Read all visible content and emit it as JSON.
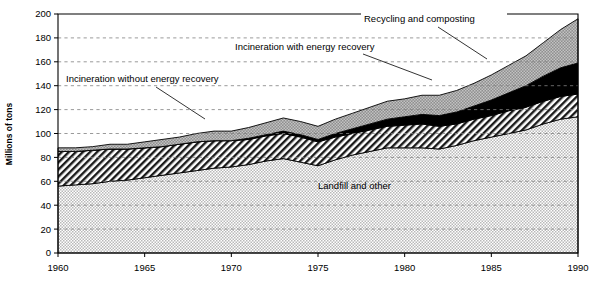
{
  "chart": {
    "type": "area",
    "ylabel": "Millions of tons",
    "xlabel": "",
    "title": "",
    "ylim": [
      0,
      200
    ],
    "xlim": [
      1960,
      1990
    ],
    "yticks": [
      "0",
      "20",
      "40",
      "60",
      "80",
      "100",
      "120",
      "140",
      "160",
      "180",
      "200"
    ],
    "xticks": [
      "1960",
      "1965",
      "1970",
      "1975",
      "1980",
      "1985",
      "1990"
    ],
    "grid": "horizontal-dashed",
    "legend_position": "inline-annotations",
    "colors": {
      "landfill": "#d4d4d4",
      "incineration_without": "#ffffff",
      "incineration_with": "#000000",
      "recycling": "#a8a8a8",
      "gridline": "#808080",
      "axis": "#000000"
    },
    "annotations": [
      {
        "id": "recycling",
        "label": "Recycling and composting"
      },
      {
        "id": "inc_with",
        "label": "Incineration with energy recovery"
      },
      {
        "id": "inc_without",
        "label": "Incineration without energy recovery"
      },
      {
        "id": "landfill",
        "label": "Landfill and other"
      }
    ]
  },
  "chart_data": {
    "type": "area",
    "stacked": true,
    "title": "",
    "xlabel": "",
    "ylabel": "Millions of tons",
    "ylim": [
      0,
      200
    ],
    "xlim": [
      1960,
      1990
    ],
    "grid": true,
    "legend_position": "inline-annotations",
    "x": [
      1960,
      1961,
      1962,
      1963,
      1964,
      1965,
      1966,
      1967,
      1968,
      1969,
      1970,
      1971,
      1972,
      1973,
      1974,
      1975,
      1976,
      1977,
      1978,
      1979,
      1980,
      1981,
      1982,
      1983,
      1984,
      1985,
      1986,
      1987,
      1988,
      1989,
      1990
    ],
    "series": [
      {
        "name": "Landfill and other",
        "values": [
          56,
          57,
          58,
          60,
          61,
          63,
          65,
          67,
          69,
          71,
          72,
          74,
          77,
          79,
          76,
          73,
          78,
          82,
          85,
          88,
          88,
          88,
          87,
          90,
          94,
          97,
          100,
          103,
          108,
          112,
          114
        ]
      },
      {
        "name": "Incineration without energy recovery",
        "values": [
          29,
          28,
          28,
          27,
          26,
          25,
          24,
          24,
          24,
          23,
          22,
          21,
          21,
          21,
          21,
          20,
          19,
          18,
          18,
          18,
          19,
          20,
          19,
          18,
          18,
          18,
          19,
          19,
          19,
          19,
          19
        ]
      },
      {
        "name": "Incineration with energy recovery",
        "values": [
          0,
          0,
          0,
          0,
          0,
          0,
          0,
          0,
          0,
          0,
          0,
          1,
          1,
          2,
          2,
          2,
          3,
          4,
          5,
          6,
          7,
          8,
          9,
          10,
          11,
          13,
          15,
          18,
          21,
          24,
          26
        ]
      },
      {
        "name": "Recycling and composting",
        "values": [
          3,
          3,
          3,
          4,
          4,
          5,
          6,
          6,
          7,
          8,
          8,
          9,
          10,
          11,
          11,
          11,
          12,
          13,
          14,
          15,
          15,
          16,
          17,
          18,
          19,
          21,
          23,
          25,
          28,
          32,
          37
        ]
      }
    ],
    "totals": [
      88,
      88,
      89,
      91,
      91,
      93,
      95,
      97,
      100,
      102,
      102,
      105,
      109,
      113,
      110,
      106,
      112,
      117,
      122,
      127,
      129,
      132,
      132,
      136,
      142,
      149,
      157,
      165,
      176,
      187,
      196
    ]
  }
}
